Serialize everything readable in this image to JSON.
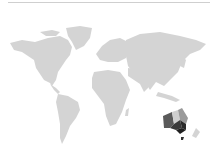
{
  "map": {
    "type": "world-choropleth",
    "base_land_color": "#d4d4d4",
    "highlight_region": "Australia",
    "regions": [
      {
        "name": "Western Australia",
        "color": "#5a5a5a"
      },
      {
        "name": "Northern Territory",
        "color": "#cfcfcf"
      },
      {
        "name": "Queensland",
        "color": "#9a9a9a"
      },
      {
        "name": "South Australia",
        "color": "#3a3a3a"
      },
      {
        "name": "New South Wales",
        "color": "#2a2a2a"
      },
      {
        "name": "Victoria",
        "color": "#202020"
      },
      {
        "name": "Tasmania",
        "color": "#303030"
      }
    ]
  }
}
